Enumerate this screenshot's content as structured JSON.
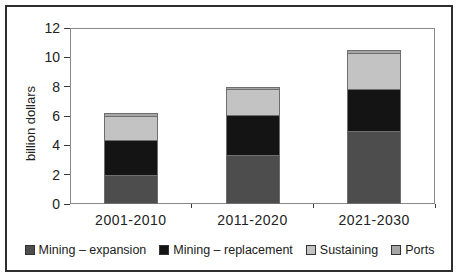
{
  "figure": {
    "ylabel": "billion dollars"
  },
  "chart_data": {
    "type": "bar",
    "stacked": true,
    "title": "",
    "xlabel": "",
    "ylabel": "billion dollars",
    "categories": [
      "2001-2010",
      "2011-2020",
      "2021-2030"
    ],
    "series": [
      {
        "name": "Mining – expansion",
        "color": "#4d4d4d",
        "values": [
          1.9,
          3.3,
          4.9
        ]
      },
      {
        "name": "Mining – replacement",
        "color": "#141414",
        "values": [
          2.4,
          2.7,
          2.9
        ]
      },
      {
        "name": "Sustaining",
        "color": "#c3c3c3",
        "values": [
          1.6,
          1.8,
          2.4
        ]
      },
      {
        "name": "Ports",
        "color": "#a6a6a6",
        "values": [
          0.3,
          0.2,
          0.3
        ]
      }
    ],
    "totals": [
      6.2,
      8.0,
      10.5
    ],
    "ylim": [
      0,
      12
    ],
    "yticks": [
      0,
      2,
      4,
      6,
      8,
      10,
      12
    ],
    "grid": false,
    "legend_position": "bottom",
    "frame_color": "#2e2e2e",
    "plot_border_color": "#8a8a8a"
  }
}
